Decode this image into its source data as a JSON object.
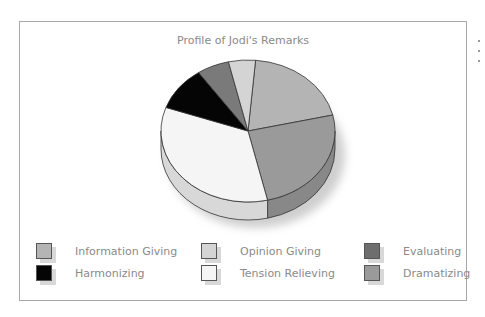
{
  "chart_data": {
    "type": "pie",
    "title": "Profile of Jodi's Remarks",
    "style": "3d-pie",
    "legend_position": "bottom",
    "start_angle_deg": 5,
    "direction": "clockwise",
    "slices": [
      {
        "name": "Information Giving",
        "value": 20,
        "color": "#b4b4b4"
      },
      {
        "name": "Dramatizing",
        "value": 25,
        "color": "#9a9a9a"
      },
      {
        "name": "Tension Relieving",
        "value": 34,
        "color": "#f5f5f5"
      },
      {
        "name": "Harmonizing",
        "value": 10,
        "color": "#050505"
      },
      {
        "name": "Evaluating",
        "value": 6,
        "color": "#7a7a7a"
      },
      {
        "name": "Opinion Giving",
        "value": 5,
        "color": "#d4d4d4"
      }
    ]
  },
  "legend": [
    {
      "label": "Information Giving",
      "color": "#b4b4b4"
    },
    {
      "label": "Opinion Giving",
      "color": "#d4d4d4"
    },
    {
      "label": "Evaluating",
      "color": "#6e6e6e"
    },
    {
      "label": "Harmonizing",
      "color": "#050505"
    },
    {
      "label": "Tension Relieving",
      "color": "#f5f5f5"
    },
    {
      "label": "Dramatizing",
      "color": "#9a9a9a"
    }
  ]
}
